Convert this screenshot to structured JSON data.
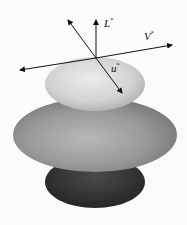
{
  "figure": {
    "labels": {
      "L": "L",
      "V": "V",
      "u": "u",
      "star": "*"
    },
    "shapes": [
      "top-ellipsoid",
      "middle-ellipsoid",
      "base-disc"
    ],
    "vectors": [
      "L-vector",
      "V-vector",
      "u-vector"
    ],
    "colors": {
      "background": "#fbfbfb",
      "top": "#d6d6d6",
      "middle": "#9a9a9a",
      "base": "#3a3a3a",
      "vector": "#111111"
    }
  }
}
